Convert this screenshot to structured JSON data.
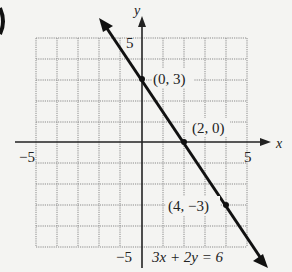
{
  "figure": {
    "axes": {
      "x_label": "x",
      "y_label": "y",
      "x_min_label": "−5",
      "x_max_label": "5",
      "y_max_label": "5",
      "y_min_label": "−5"
    },
    "points": [
      {
        "x": 0,
        "y": 3,
        "label": "(0, 3)"
      },
      {
        "x": 2,
        "y": 0,
        "label": "(2, 0)"
      },
      {
        "x": 4,
        "y": -3,
        "label": "(4, −3)"
      }
    ],
    "equation": "3x + 2y = 6",
    "colors": {
      "line": "#111111",
      "grid": "#888888",
      "axis": "#222222"
    }
  }
}
